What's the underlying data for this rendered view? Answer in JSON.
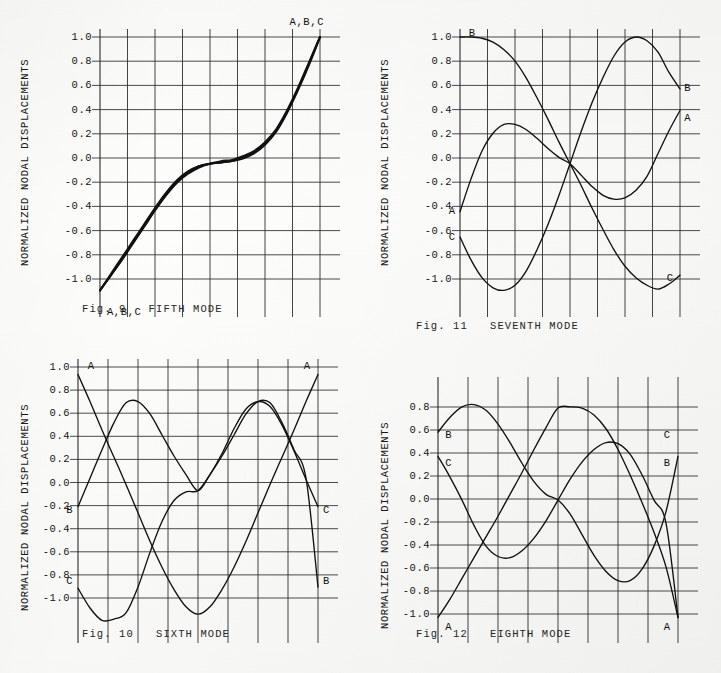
{
  "page": {
    "document_type": "scanned-figure-page",
    "axis_label": "NORMALIZED NODAL DISPLACEMENTS"
  },
  "figures": [
    {
      "id": "fig9",
      "caption": "Fig. 9   FIFTH MODE",
      "ylabel": "NORMALIZED NODAL DISPLACEMENTS",
      "yticks": [
        "1.0",
        "0.8",
        "0.6",
        "0.4",
        "0.2",
        "0.0",
        "-0.2",
        "-0.4",
        "-0.6",
        "-0.8",
        "-1.0"
      ],
      "labels": [
        {
          "text": "A,B,C",
          "x": 0.94,
          "y": 1.12
        },
        {
          "text": "A,B,C",
          "x": 0.11,
          "y": -1.17
        }
      ]
    },
    {
      "id": "fig11",
      "caption": "Fig. 11   SEVENTH MODE",
      "ylabel": "NORMALIZED NODAL DISPLACEMENTS",
      "yticks": [
        "1.0",
        "0.8",
        "0.6",
        "0.4",
        "0.2",
        "0.0",
        "-0.2",
        "-0.4",
        "-0.6",
        "-0.8",
        "-1.0"
      ],
      "labels": [
        {
          "text": "B",
          "x": 0.055,
          "y": 1.03
        },
        {
          "text": "B",
          "x": 1.035,
          "y": 0.6
        },
        {
          "text": "A",
          "x": 1.035,
          "y": 0.36
        },
        {
          "text": "A",
          "x": -0.035,
          "y": -0.37
        },
        {
          "text": "C",
          "x": -0.035,
          "y": -0.58
        },
        {
          "text": "C",
          "x": 0.955,
          "y": -0.9
        }
      ]
    },
    {
      "id": "fig10",
      "caption": "Fig. 10   SIXTH MODE",
      "ylabel": "NORMALIZED NODAL DISPLACEMENTS",
      "yticks": [
        "1.0",
        "0.8",
        "0.6",
        "0.4",
        "0.2",
        "0.0",
        "-0.2",
        "-0.4",
        "-0.6",
        "-0.8",
        "-1.0"
      ],
      "labels": [
        {
          "text": "A",
          "x": 0.055,
          "y": 1.01
        },
        {
          "text": "A",
          "x": 0.955,
          "y": 1.01
        },
        {
          "text": "B",
          "x": -0.035,
          "y": -0.155
        },
        {
          "text": "C",
          "x": 1.035,
          "y": -0.155
        },
        {
          "text": "C",
          "x": -0.035,
          "y": -0.73
        },
        {
          "text": "B",
          "x": 1.035,
          "y": -0.73
        }
      ]
    },
    {
      "id": "fig12",
      "caption": "Fig. 12   EIGHTH MODE",
      "ylabel": "NORMALIZED NODAL DISPLACEMENTS",
      "yticks": [
        "0.8",
        "0.6",
        "0.4",
        "0.2",
        "0.0",
        "-0.2",
        "-0.4",
        "-0.6",
        "-0.8",
        "-1.0"
      ],
      "labels": [
        {
          "text": "B",
          "x": 0.045,
          "y": 0.565
        },
        {
          "text": "C",
          "x": 0.955,
          "y": 0.565
        },
        {
          "text": "C",
          "x": 0.045,
          "y": 0.325
        },
        {
          "text": "B",
          "x": 0.955,
          "y": 0.325
        },
        {
          "text": "A",
          "x": 0.045,
          "y": -1.1
        },
        {
          "text": "A",
          "x": 0.955,
          "y": -1.1
        }
      ]
    }
  ],
  "chart_data": [
    {
      "type": "line",
      "title": "Fig. 9   FIFTH MODE",
      "xlabel": "",
      "ylabel": "NORMALIZED NODAL DISPLACEMENTS",
      "ylim": [
        -1.0,
        1.0
      ],
      "xlim": [
        0,
        1
      ],
      "grid": true,
      "legend": [
        "A",
        "B",
        "C"
      ],
      "legend_position": "inline-endpoint-labels",
      "x": [
        0.0,
        0.05,
        0.1,
        0.15,
        0.2,
        0.25,
        0.3,
        0.35,
        0.4,
        0.45,
        0.5,
        0.55,
        0.6,
        0.65,
        0.7,
        0.75,
        0.8,
        0.85,
        0.9,
        0.95,
        1.0
      ],
      "series": [
        {
          "name": "A",
          "values": [
            -1.0,
            -0.88,
            -0.76,
            -0.63,
            -0.5,
            -0.37,
            -0.25,
            -0.15,
            -0.08,
            -0.03,
            0.0,
            0.01,
            0.02,
            0.04,
            0.08,
            0.15,
            0.25,
            0.4,
            0.58,
            0.78,
            1.0
          ]
        },
        {
          "name": "B",
          "values": [
            -1.0,
            -0.88,
            -0.75,
            -0.62,
            -0.49,
            -0.36,
            -0.24,
            -0.14,
            -0.07,
            -0.02,
            0.0,
            0.01,
            0.02,
            0.05,
            0.09,
            0.16,
            0.26,
            0.41,
            0.59,
            0.79,
            1.0
          ]
        },
        {
          "name": "C",
          "values": [
            -1.0,
            -0.87,
            -0.74,
            -0.61,
            -0.48,
            -0.35,
            -0.23,
            -0.13,
            -0.06,
            -0.02,
            0.0,
            0.02,
            0.03,
            0.06,
            0.1,
            0.17,
            0.27,
            0.42,
            0.6,
            0.8,
            1.0
          ]
        }
      ]
    },
    {
      "type": "line",
      "title": "Fig. 11   SEVENTH MODE",
      "xlabel": "",
      "ylabel": "NORMALIZED NODAL DISPLACEMENTS",
      "ylim": [
        -1.0,
        1.0
      ],
      "xlim": [
        0,
        1
      ],
      "grid": true,
      "legend": [
        "A",
        "B",
        "C"
      ],
      "legend_position": "inline-endpoint-labels",
      "x": [
        0.0,
        0.05,
        0.1,
        0.15,
        0.2,
        0.25,
        0.3,
        0.35,
        0.4,
        0.45,
        0.5,
        0.55,
        0.6,
        0.65,
        0.7,
        0.75,
        0.8,
        0.85,
        0.9,
        0.95,
        1.0
      ],
      "series": [
        {
          "name": "B",
          "values": [
            1.0,
            1.0,
            0.99,
            0.96,
            0.9,
            0.81,
            0.68,
            0.52,
            0.35,
            0.17,
            0.0,
            -0.17,
            -0.35,
            -0.52,
            -0.68,
            -0.81,
            -0.9,
            -0.96,
            -0.99,
            -0.95,
            -0.88
          ]
        },
        {
          "name": "A",
          "values": [
            -0.38,
            -0.12,
            0.1,
            0.24,
            0.31,
            0.31,
            0.27,
            0.2,
            0.12,
            0.05,
            0.0,
            -0.09,
            -0.18,
            -0.25,
            -0.28,
            -0.27,
            -0.21,
            -0.1,
            0.08,
            0.26,
            0.42
          ]
        },
        {
          "name": "C",
          "values": [
            -0.58,
            -0.76,
            -0.9,
            -0.98,
            -1.0,
            -0.96,
            -0.85,
            -0.68,
            -0.48,
            -0.25,
            0.0,
            0.25,
            0.48,
            0.68,
            0.85,
            0.96,
            1.0,
            0.97,
            0.88,
            0.72,
            0.59
          ]
        }
      ]
    },
    {
      "type": "line",
      "title": "Fig. 10   SIXTH MODE",
      "xlabel": "",
      "ylabel": "NORMALIZED NODAL DISPLACEMENTS",
      "ylim": [
        -1.1,
        1.0
      ],
      "xlim": [
        0,
        1
      ],
      "grid": true,
      "legend": [
        "A",
        "B",
        "C"
      ],
      "legend_position": "inline-endpoint-labels",
      "x": [
        0.0,
        0.05,
        0.1,
        0.15,
        0.2,
        0.25,
        0.3,
        0.35,
        0.4,
        0.45,
        0.5,
        0.55,
        0.6,
        0.65,
        0.7,
        0.75,
        0.8,
        0.85,
        0.9,
        0.95,
        1.0
      ],
      "series": [
        {
          "name": "A",
          "values": [
            0.94,
            0.72,
            0.49,
            0.27,
            0.05,
            -0.18,
            -0.41,
            -0.62,
            -0.8,
            -0.94,
            -1.0,
            -0.94,
            -0.8,
            -0.62,
            -0.41,
            -0.18,
            0.05,
            0.27,
            0.49,
            0.72,
            0.94
          ]
        },
        {
          "name": "B",
          "values": [
            -0.13,
            0.1,
            0.33,
            0.55,
            0.71,
            0.72,
            0.62,
            0.45,
            0.28,
            0.13,
            0.0,
            0.13,
            0.28,
            0.45,
            0.62,
            0.72,
            0.71,
            0.55,
            0.33,
            0.1,
            -0.78
          ]
        },
        {
          "name": "C",
          "values": [
            -0.79,
            -0.95,
            -1.05,
            -1.04,
            -0.99,
            -0.78,
            -0.5,
            -0.25,
            -0.08,
            -0.01,
            0.0,
            0.13,
            0.3,
            0.5,
            0.66,
            0.72,
            0.68,
            0.53,
            0.32,
            0.09,
            -0.13
          ]
        }
      ]
    },
    {
      "type": "line",
      "title": "Fig. 12   EIGHTH MODE",
      "xlabel": "",
      "ylabel": "NORMALIZED NODAL DISPLACEMENTS",
      "ylim": [
        -1.1,
        1.0
      ],
      "xlim": [
        0,
        1
      ],
      "grid": true,
      "legend": [
        "A",
        "B",
        "C"
      ],
      "legend_position": "inline-endpoint-labels",
      "x": [
        0.0,
        0.05,
        0.1,
        0.15,
        0.2,
        0.25,
        0.3,
        0.35,
        0.4,
        0.45,
        0.5,
        0.55,
        0.6,
        0.65,
        0.7,
        0.75,
        0.8,
        0.85,
        0.9,
        0.95,
        1.0
      ],
      "series": [
        {
          "name": "B",
          "values": [
            0.59,
            0.72,
            0.81,
            0.83,
            0.78,
            0.66,
            0.5,
            0.32,
            0.16,
            0.05,
            0.0,
            -0.12,
            -0.3,
            -0.48,
            -0.62,
            -0.7,
            -0.7,
            -0.6,
            -0.4,
            -0.1,
            0.38
          ]
        },
        {
          "name": "C",
          "values": [
            0.38,
            0.2,
            0.0,
            -0.22,
            -0.4,
            -0.49,
            -0.5,
            -0.44,
            -0.33,
            -0.18,
            0.0,
            0.18,
            0.33,
            0.44,
            0.5,
            0.49,
            0.4,
            0.22,
            0.0,
            -0.2,
            -1.02
          ]
        },
        {
          "name": "A",
          "values": [
            -1.02,
            -0.86,
            -0.68,
            -0.5,
            -0.32,
            -0.14,
            0.05,
            0.24,
            0.44,
            0.63,
            0.8,
            0.81,
            0.8,
            0.74,
            0.62,
            0.44,
            0.22,
            -0.02,
            -0.28,
            -0.58,
            -1.02
          ]
        }
      ]
    }
  ]
}
